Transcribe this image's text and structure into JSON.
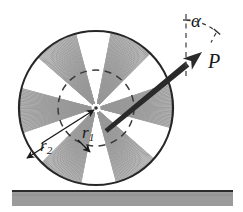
{
  "figure": {
    "background_color": "#ffffff",
    "width": 243,
    "height": 212
  },
  "labels": {
    "alpha": "α",
    "force": "P",
    "radius_inner_base": "r",
    "radius_inner_sub": "1",
    "radius_outer_base": "r",
    "radius_outer_sub": "2"
  },
  "colors": {
    "ink": "#1a1a1a",
    "outline": "#262626",
    "hatch": "#8a8a8a",
    "hatch_light": "#a8a8a8",
    "dashed": "#3a3a3a",
    "ground_fill": "#9b9b9b",
    "ground_edge": "#2b2b2b",
    "arrow": "#2a2a2a"
  },
  "geometry": {
    "wheel_center_x": 96,
    "wheel_center_y": 108,
    "wheel_outer_radius": 77,
    "wheel_inner_radius": 38,
    "hub_radius": 5,
    "spoke_count": 6,
    "spoke_half_width_deg": 17,
    "force_tail_x": 106,
    "force_tail_y": 131,
    "force_tip_x": 202,
    "force_tip_y": 52,
    "vertical_ref_x": 186,
    "vertical_ref_top_y": 14,
    "vertical_ref_bottom_y": 78,
    "alpha_arc_radius": 46,
    "ground_top_y": 191,
    "ground_bottom_y": 205,
    "ground_left_x": 12,
    "ground_right_x": 233
  },
  "annotations": {
    "alpha_description": "angle between vertical reference and force P",
    "r1_description": "inner radius leader pointing to dashed inner circle",
    "r2_description": "outer radius leader pointing to outer wheel rim",
    "contact_point_description": "wheel rests on horizontal ground"
  }
}
